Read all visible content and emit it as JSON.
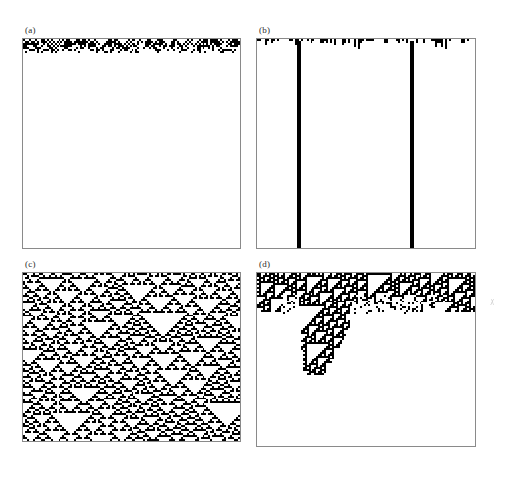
{
  "figure": {
    "background_color": "#ffffff",
    "cell_on_color": "#000000",
    "cell_off_color": "#ffffff",
    "frame_color": "#8a8a8a",
    "label_color": "#2b2b2b",
    "width": 507,
    "height": 503,
    "rows": 2,
    "columns": 2
  },
  "panels": [
    {
      "id": "a",
      "label": "(a)",
      "class_name": "Class 1 — evolves to homogeneous state",
      "frame": {
        "left": 22,
        "top": 38,
        "width": 219,
        "height": 211
      },
      "label_pos": {
        "left": 25,
        "top": 25
      },
      "grid": {
        "columns": 110,
        "rows": 105
      },
      "rule": 250,
      "initial_density": 0.5,
      "description": "Dense random initial row decays within a few steps to an empty (all-white) state; only small inverted-triangle remnants survive near the top.",
      "active_rows": 7,
      "seed": 1471
    },
    {
      "id": "b",
      "label": "(b)",
      "class_name": "Class 2 — evolves to stable periodic structures",
      "frame": {
        "left": 256,
        "top": 38,
        "width": 220,
        "height": 211
      },
      "label_pos": {
        "left": 259,
        "top": 25
      },
      "grid": {
        "columns": 110,
        "rows": 105
      },
      "rule": 108,
      "initial_density": 0.5,
      "description": "Random initial row settles after a few steps into two persistent vertical stripes that continue unchanged to the bottom of the panel.",
      "active_rows": 5,
      "stripe_columns": [
        20,
        77
      ],
      "stripe_width_cells": 2,
      "seed": 905
    },
    {
      "id": "c",
      "label": "(c)",
      "class_name": "Class 3 — chaotic, aperiodic behavior",
      "frame": {
        "left": 22,
        "top": 272,
        "width": 219,
        "height": 170
      },
      "label_pos": {
        "left": 25,
        "top": 259
      },
      "grid": {
        "columns": 110,
        "rows": 85
      },
      "rule": 22,
      "initial_density": 0.5,
      "description": "Random initial row produces sustained chaotic activity filling the whole panel, with self-similar nested white triangles of many sizes.",
      "seed": 3011
    },
    {
      "id": "d",
      "label": "(d)",
      "class_name": "Class 4 — complex localized structures",
      "frame": {
        "left": 256,
        "top": 272,
        "width": 220,
        "height": 175
      },
      "label_pos": {
        "left": 259,
        "top": 259
      },
      "grid": {
        "columns": 110,
        "rows": 88
      },
      "rule": 110,
      "initial_density": 0.5,
      "description": "Most of the random initial row dies out, leaving isolated propagating structures; one long-lived tangle persists and finally decays near the middle of the panel.",
      "seed": 7733
    }
  ],
  "artifact": {
    "name": "scan-speck",
    "pos": {
      "left": 489,
      "top": 299
    }
  }
}
